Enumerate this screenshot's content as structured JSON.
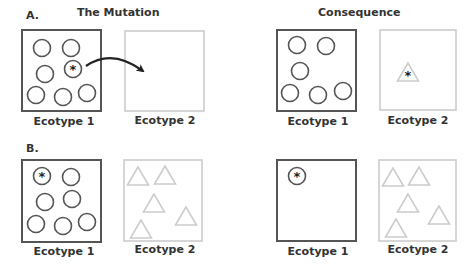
{
  "colors": {
    "dark_stroke": "#555555",
    "light_stroke": "#cccccc",
    "text": "#333333",
    "arrow": "#222222"
  },
  "titles": {
    "mutation": "The Mutation",
    "consequence": "Consequence"
  },
  "panels": [
    {
      "letter": "A.",
      "mutation": {
        "ecotype1": {
          "label": "Ecotype 1",
          "box": [
            22,
            30,
            79,
            81
          ],
          "circles": [
            [
              42,
              48
            ],
            [
              71,
              48
            ],
            [
              45,
              74
            ],
            [
              36,
              95
            ],
            [
              63,
              97
            ],
            [
              87,
              93
            ]
          ],
          "mutant_circles": [
            [
              73,
              69
            ]
          ]
        },
        "ecotype2": {
          "label": "Ecotype 2",
          "box": [
            125,
            31,
            79,
            80
          ],
          "triangles": []
        },
        "arrow": "invasion-arrow"
      },
      "consequence": {
        "ecotype1": {
          "label": "Ecotype 1",
          "box": [
            277,
            30,
            79,
            81
          ],
          "circles": [
            [
              297,
              45
            ],
            [
              326,
              46
            ],
            [
              300,
              71
            ],
            [
              290,
              93
            ],
            [
              318,
              95
            ],
            [
              343,
              91
            ]
          ],
          "mutant_circles": []
        },
        "ecotype2": {
          "label": "Ecotype 2",
          "box": [
            380,
            30,
            76,
            80
          ],
          "triangles": [],
          "mutant_triangles": [
            [
              408,
              72
            ]
          ]
        }
      }
    },
    {
      "letter": "B.",
      "mutation": {
        "ecotype1": {
          "label": "Ecotype 1",
          "box": [
            22,
            160,
            79,
            82
          ],
          "circles": [
            [
              71,
              177
            ],
            [
              45,
              202
            ],
            [
              72,
              199
            ],
            [
              36,
              224
            ],
            [
              63,
              226
            ],
            [
              87,
              222
            ]
          ],
          "mutant_circles": [
            [
              42,
              176
            ]
          ]
        },
        "ecotype2": {
          "label": "Ecotype 2",
          "box": [
            124,
            160,
            78,
            81
          ],
          "triangles": [
            [
              138,
              176
            ],
            [
              165,
              175
            ],
            [
              154,
              203
            ],
            [
              186,
              216
            ],
            [
              141,
              229
            ]
          ]
        }
      },
      "consequence": {
        "ecotype1": {
          "label": "Ecotype 1",
          "box": [
            277,
            160,
            79,
            81
          ],
          "circles": [],
          "mutant_circles": [
            [
              297,
              176
            ]
          ]
        },
        "ecotype2": {
          "label": "Ecotype 2",
          "box": [
            379,
            160,
            77,
            81
          ],
          "triangles": [
            [
              393,
              177
            ],
            [
              419,
              176
            ],
            [
              408,
              203
            ],
            [
              439,
              215
            ],
            [
              396,
              228
            ]
          ],
          "mutant_triangles": []
        }
      }
    }
  ]
}
